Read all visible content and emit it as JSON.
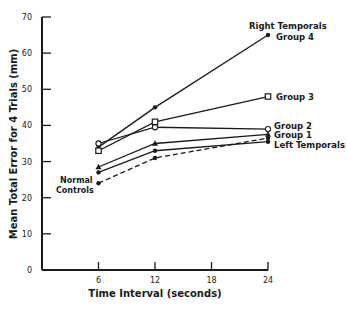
{
  "chart_data": {
    "type": "line",
    "title": "",
    "xlabel": "Time Interval (seconds)",
    "ylabel": "Mean Total Error for 4 Trials (mm)",
    "x": [
      6,
      12,
      24
    ],
    "xticks": [
      6,
      12,
      18,
      24
    ],
    "yticks": [
      0,
      10,
      20,
      30,
      40,
      50,
      60,
      70
    ],
    "xlim": [
      0,
      24
    ],
    "ylim": [
      0,
      70
    ],
    "grid": false,
    "legend_position": "inline-right",
    "annotations": [
      "Right Temporals",
      "Normal Controls"
    ],
    "series": [
      {
        "name": "Group 4",
        "marker": "filled-circle",
        "line": "solid",
        "values": [
          34,
          45,
          65
        ]
      },
      {
        "name": "Group 3",
        "marker": "open-square",
        "line": "solid",
        "values": [
          33,
          41,
          48
        ]
      },
      {
        "name": "Group 2",
        "marker": "open-circle",
        "line": "solid",
        "values": [
          35,
          39.5,
          39
        ]
      },
      {
        "name": "Group 1",
        "marker": "filled-triangle",
        "line": "solid",
        "values": [
          28.5,
          35,
          37.5
        ]
      },
      {
        "name": "Left Temporals",
        "marker": "filled-circle",
        "line": "solid",
        "values": [
          27,
          33,
          35.5
        ]
      },
      {
        "name": "Normal Controls",
        "marker": "filled-circle",
        "line": "dashed",
        "values": [
          24,
          31,
          36.5
        ]
      }
    ]
  },
  "labels": {
    "right_temporals": "Right Temporals",
    "group4": "Group 4",
    "group3": "Group 3",
    "group2": "Group 2",
    "group1": "Group 1",
    "left_temporals": "Left Temporals",
    "normal": "Normal",
    "controls": "Controls"
  }
}
